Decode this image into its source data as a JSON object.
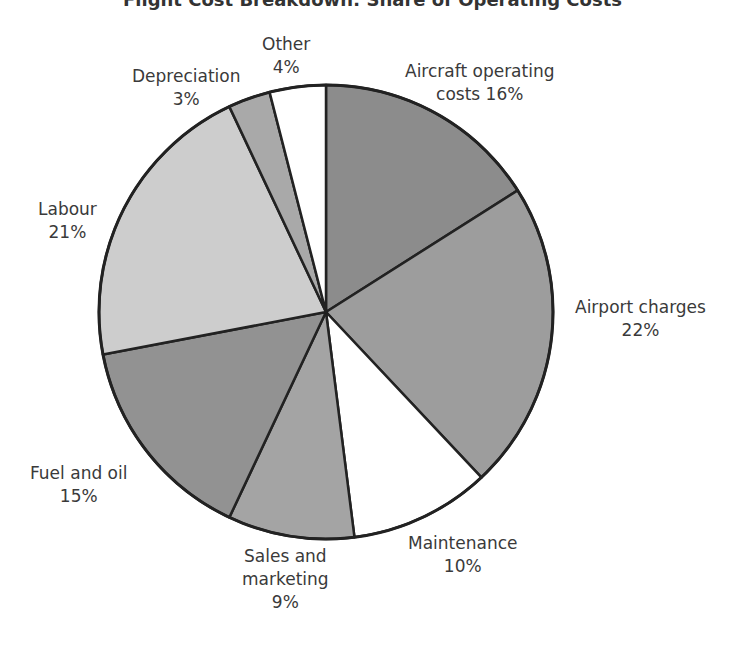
{
  "chart_data": {
    "type": "pie",
    "title": "Flight Cost Breakdown: Share of Operating Costs",
    "title_note": "Title is cropped at the top edge of the image; partially legible.",
    "categories": [
      "Aircraft operating costs",
      "Airport charges",
      "Maintenance",
      "Sales and marketing",
      "Fuel and oil",
      "Labour",
      "Depreciation",
      "Other"
    ],
    "values": [
      16,
      22,
      10,
      9,
      15,
      21,
      3,
      4
    ],
    "unit": "%",
    "start_angle_deg": 0,
    "direction": "clockwise",
    "colors": [
      "#8c8c8c",
      "#9d9d9d",
      "#ffffff",
      "#a4a4a4",
      "#929292",
      "#cdcdcd",
      "#a9a9a9",
      "#ffffff"
    ],
    "legend": "none (direct labels)",
    "center": [
      326,
      312
    ],
    "radius": 227
  },
  "labels": {
    "aircraft": {
      "line1": "Aircraft operating",
      "line2": "costs 16%"
    },
    "airport": {
      "line1": "Airport charges",
      "line2": "22%"
    },
    "maintenance": {
      "line1": "Maintenance",
      "line2": "10%"
    },
    "sales": {
      "line1": "Sales and",
      "line2": "marketing",
      "line3": "9%"
    },
    "fuel": {
      "line1": "Fuel and oil",
      "line2": "15%"
    },
    "labour": {
      "line1": "Labour",
      "line2": "21%"
    },
    "depreciation": {
      "line1": "Depreciation",
      "line2": "3%"
    },
    "other": {
      "line1": "Other",
      "line2": "4%"
    }
  }
}
